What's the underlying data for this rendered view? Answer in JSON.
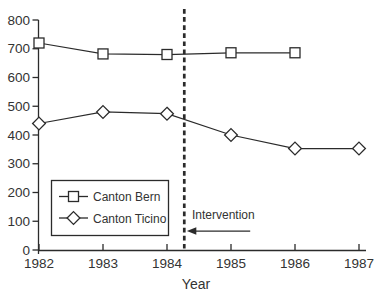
{
  "chart_data": {
    "type": "line",
    "title": "",
    "xlabel": "Year",
    "ylabel": "",
    "xlim": [
      1982,
      1987
    ],
    "ylim": [
      0,
      800
    ],
    "x_ticks": [
      1982,
      1983,
      1984,
      1985,
      1986,
      1987
    ],
    "y_ticks": [
      0,
      100,
      200,
      300,
      400,
      500,
      600,
      700,
      800
    ],
    "grid": false,
    "legend_position": "lower-left-inside",
    "series": [
      {
        "name": "Canton Bern",
        "marker": "square",
        "x": [
          1982,
          1983,
          1984,
          1985,
          1986
        ],
        "values": [
          720,
          682,
          680,
          686,
          686
        ]
      },
      {
        "name": "Canton Ticino",
        "marker": "diamond",
        "x": [
          1982,
          1983,
          1984,
          1985,
          1986,
          1987
        ],
        "values": [
          440,
          480,
          474,
          400,
          353,
          353
        ]
      }
    ],
    "annotations": {
      "intervention_label": "Intervention",
      "intervention_line_x": 1984.27,
      "label_x": 1984.39,
      "label_y": 107,
      "arrow": {
        "from_x": 1985.3,
        "tip_x": 1984.31,
        "y": 66,
        "direction": "left"
      }
    },
    "colors": {
      "line": "#2b2b2b",
      "text": "#333333",
      "marker_fill": "#ffffff",
      "background": "#ffffff"
    }
  }
}
